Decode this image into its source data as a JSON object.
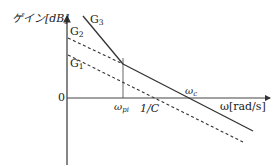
{
  "diagram": {
    "type": "bode-gain-asymptote",
    "y_axis_label": "ゲイン[dB]",
    "x_axis_label": "ω[rad/s]",
    "origin_label": "0",
    "curves": [
      {
        "name": "G1",
        "label_main": "G",
        "label_sub": "1",
        "style": "dashed"
      },
      {
        "name": "G2",
        "label_main": "G",
        "label_sub": "2",
        "style": "dashed"
      },
      {
        "name": "G3",
        "label_main": "G",
        "label_sub": "3",
        "style": "solid"
      }
    ],
    "x_markers": [
      {
        "name": "omega_pi",
        "label_main": "ω",
        "label_sub": "pi"
      },
      {
        "name": "one_over_C",
        "label": "1/C"
      },
      {
        "name": "omega_c",
        "label_main": "ω",
        "label_sub": "c"
      }
    ],
    "colors": {
      "line": "#333333",
      "axis": "#444444"
    }
  }
}
